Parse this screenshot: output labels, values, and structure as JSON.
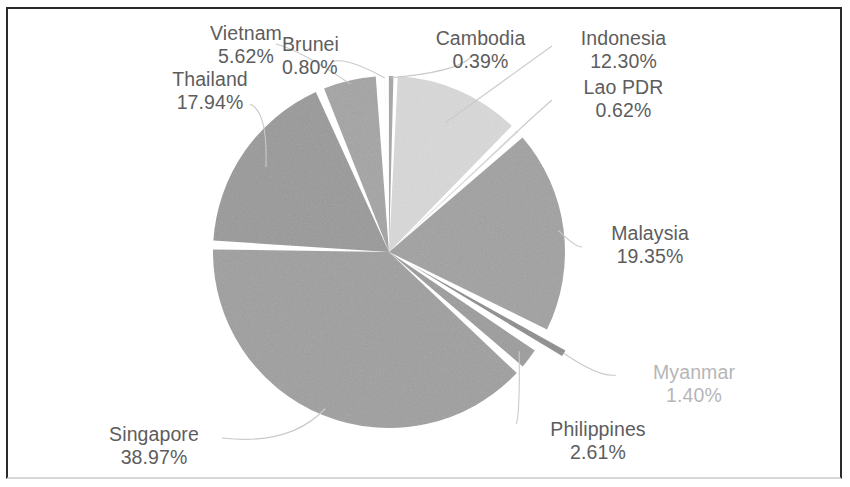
{
  "chart_data": {
    "type": "pie",
    "title": "",
    "subtitle": "",
    "xlabel": "",
    "ylabel": "",
    "legend_position": "none",
    "grid": false,
    "labels_show_percent": true,
    "value_unit": "%",
    "total": 100.0,
    "categories": [
      "Cambodia",
      "Indonesia",
      "Lao PDR",
      "Malaysia",
      "Myanmar",
      "Philippines",
      "Singapore",
      "Thailand",
      "Vietnam",
      "Brunei"
    ],
    "values": [
      0.39,
      12.3,
      0.62,
      19.35,
      1.4,
      2.61,
      38.97,
      17.94,
      5.62,
      0.8
    ],
    "slices": [
      {
        "name": "Cambodia",
        "value": 0.39,
        "percent_text": "0.39%",
        "color": "#a6a6a6",
        "exploded": false
      },
      {
        "name": "Indonesia",
        "value": 12.3,
        "percent_text": "12.30%",
        "color": "#d9d9d9",
        "exploded": false
      },
      {
        "name": "Lao PDR",
        "value": 0.62,
        "percent_text": "0.62%",
        "color": "#d9d9d9",
        "exploded": false
      },
      {
        "name": "Malaysia",
        "value": 19.35,
        "percent_text": "19.35%",
        "color": "#a0a0a0",
        "exploded": false
      },
      {
        "name": "Myanmar",
        "value": 1.4,
        "percent_text": "1.40%",
        "color": "#8c8c8c",
        "exploded": true
      },
      {
        "name": "Philippines",
        "value": 2.61,
        "percent_text": "2.61%",
        "color": "#9b9b9b",
        "exploded": false
      },
      {
        "name": "Singapore",
        "value": 38.97,
        "percent_text": "38.97%",
        "color": "#9e9e9e",
        "exploded": false
      },
      {
        "name": "Thailand",
        "value": 17.94,
        "percent_text": "17.94%",
        "color": "#989898",
        "exploded": false
      },
      {
        "name": "Vietnam",
        "value": 5.62,
        "percent_text": "5.62%",
        "color": "#a3a3a3",
        "exploded": false
      },
      {
        "name": "Brunei",
        "value": 0.8,
        "percent_text": "0.80%",
        "color": "#a3a3a3",
        "exploded": false
      }
    ]
  },
  "labels": {
    "vietnam": {
      "name": "Vietnam",
      "percent": "5.62%"
    },
    "brunei": {
      "name": "Brunei",
      "percent": "0.80%"
    },
    "thailand": {
      "name": "Thailand",
      "percent": "17.94%"
    },
    "cambodia": {
      "name": "Cambodia",
      "percent": "0.39%"
    },
    "indonesia": {
      "name": "Indonesia",
      "percent": "12.30%"
    },
    "lao_pdr": {
      "name": "Lao PDR",
      "percent": "0.62%"
    },
    "malaysia": {
      "name": "Malaysia",
      "percent": "19.35%"
    },
    "myanmar": {
      "name": "Myanmar",
      "percent": "1.40%"
    },
    "philippines": {
      "name": "Philippines",
      "percent": "2.61%"
    },
    "singapore": {
      "name": "Singapore",
      "percent": "38.97%"
    }
  },
  "style": {
    "slice_gap_color": "#ffffff",
    "label_color": "#5d5d5d",
    "faint_label_color": "#b6b6b6",
    "frame_color": "#2b2b2b",
    "background": "#ffffff"
  }
}
